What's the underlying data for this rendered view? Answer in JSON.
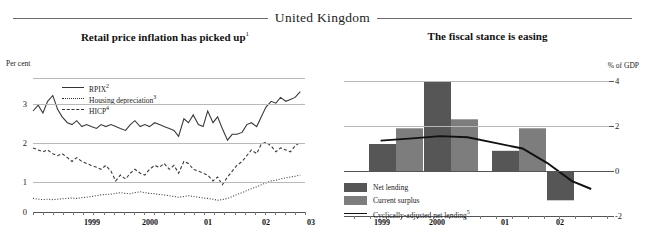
{
  "header": {
    "country": "United Kingdom"
  },
  "left_panel": {
    "title": "Retail price inflation has picked up",
    "title_sup": "1",
    "axis_label": "Per cent",
    "legend": [
      {
        "label": "RPIX",
        "sup": "2",
        "key": "solid"
      },
      {
        "label": "Housing depreciation",
        "sup": "3",
        "key": "dot"
      },
      {
        "label": "HICP",
        "sup": "4",
        "key": "dash"
      }
    ],
    "yticks": [
      "3",
      "2",
      "1",
      "0"
    ],
    "xticks": [
      "1999",
      "2000",
      "01",
      "02",
      "03"
    ]
  },
  "right_panel": {
    "title": "The fiscal stance is easing",
    "axis_label": "% of GDP",
    "legend": [
      {
        "label": "Net lending",
        "sup": "",
        "key": "swatch-dark"
      },
      {
        "label": "Current surplus",
        "sup": "",
        "key": "swatch-gray"
      },
      {
        "label": "Cyclically-adjusted net lending",
        "sup": "5",
        "key": "line"
      }
    ],
    "yticks": [
      "4",
      "2",
      "0",
      "-2"
    ],
    "xticks": [
      "1999",
      "2000",
      "01",
      "02"
    ]
  },
  "chart_data": [
    {
      "type": "line",
      "title": "Retail price inflation has picked up",
      "xlabel": "",
      "ylabel": "Per cent",
      "ylim": [
        0,
        3.45
      ],
      "xlim": [
        1998.58,
        2003.25
      ],
      "grid": true,
      "legend_position": "top-left",
      "yticks": [
        0,
        1,
        2,
        3
      ],
      "xtick_values": [
        1999,
        2000,
        2001,
        2002,
        2003
      ],
      "xtick_labels": [
        "1999",
        "2000",
        "01",
        "02",
        "03"
      ],
      "series": [
        {
          "name": "RPIX",
          "style": "solid",
          "x": [
            1998.58,
            1998.67,
            1998.75,
            1998.83,
            1998.92,
            1999.0,
            1999.08,
            1999.17,
            1999.25,
            1999.33,
            1999.42,
            1999.5,
            1999.58,
            1999.67,
            1999.75,
            1999.83,
            1999.92,
            2000.0,
            2000.08,
            2000.17,
            2000.25,
            2000.33,
            2000.42,
            2000.5,
            2000.58,
            2000.67,
            2000.75,
            2000.83,
            2000.92,
            2001.0,
            2001.08,
            2001.17,
            2001.25,
            2001.33,
            2001.42,
            2001.5,
            2001.58,
            2001.67,
            2001.75,
            2001.83,
            2001.92,
            2002.0,
            2002.08,
            2002.17,
            2002.25,
            2002.33,
            2002.42,
            2002.5,
            2002.58,
            2002.67,
            2002.75,
            2002.83,
            2002.92,
            2003.0,
            2003.08,
            2003.17
          ],
          "y": [
            2.6,
            2.75,
            2.55,
            2.85,
            3.0,
            2.65,
            2.45,
            2.3,
            2.25,
            2.35,
            2.2,
            2.25,
            2.2,
            2.15,
            2.25,
            2.2,
            2.25,
            2.2,
            2.15,
            2.1,
            2.25,
            2.35,
            2.2,
            2.25,
            2.2,
            2.3,
            2.25,
            2.2,
            2.15,
            2.1,
            1.95,
            2.4,
            2.3,
            2.5,
            2.25,
            2.2,
            2.6,
            2.3,
            2.45,
            2.15,
            1.85,
            2.0,
            2.0,
            2.05,
            2.25,
            2.3,
            2.2,
            2.45,
            2.7,
            2.85,
            2.8,
            2.95,
            2.85,
            2.9,
            2.95,
            3.1
          ],
          "annotation": "Solid dark line, RPIX inflation rate"
        },
        {
          "name": "HICP",
          "style": "dashed",
          "x": [
            1998.58,
            1998.67,
            1998.75,
            1998.83,
            1998.92,
            1999.0,
            1999.08,
            1999.17,
            1999.25,
            1999.33,
            1999.42,
            1999.5,
            1999.58,
            1999.67,
            1999.75,
            1999.83,
            1999.92,
            2000.0,
            2000.08,
            2000.17,
            2000.25,
            2000.33,
            2000.42,
            2000.5,
            2000.58,
            2000.67,
            2000.75,
            2000.83,
            2000.92,
            2001.0,
            2001.08,
            2001.17,
            2001.25,
            2001.33,
            2001.42,
            2001.5,
            2001.58,
            2001.67,
            2001.75,
            2001.83,
            2001.92,
            2002.0,
            2002.08,
            2002.17,
            2002.25,
            2002.33,
            2002.42,
            2002.5,
            2002.58,
            2002.67,
            2002.75,
            2002.83,
            2002.92,
            2003.0,
            2003.08,
            2003.17
          ],
          "y": [
            1.65,
            1.6,
            1.55,
            1.6,
            1.5,
            1.45,
            1.5,
            1.4,
            1.3,
            1.4,
            1.3,
            1.25,
            1.2,
            1.15,
            1.1,
            1.2,
            1.05,
            0.8,
            0.95,
            0.85,
            1.0,
            1.1,
            1.0,
            0.95,
            1.1,
            1.2,
            1.15,
            1.25,
            1.1,
            1.2,
            1.0,
            1.3,
            1.25,
            1.1,
            1.05,
            1.0,
            0.95,
            0.8,
            0.9,
            0.7,
            0.9,
            1.05,
            1.2,
            1.3,
            1.45,
            1.6,
            1.5,
            1.75,
            1.8,
            1.7,
            1.55,
            1.65,
            1.6,
            1.55,
            1.7,
            1.8
          ],
          "annotation": "Dashed line, HICP inflation rate"
        },
        {
          "name": "Housing depreciation",
          "style": "dotted",
          "x": [
            1998.58,
            1998.67,
            1998.75,
            1998.83,
            1998.92,
            1999.0,
            1999.08,
            1999.17,
            1999.25,
            1999.33,
            1999.42,
            1999.5,
            1999.58,
            1999.67,
            1999.75,
            1999.83,
            1999.92,
            2000.0,
            2000.08,
            2000.17,
            2000.25,
            2000.33,
            2000.42,
            2000.5,
            2000.58,
            2000.67,
            2000.75,
            2000.83,
            2000.92,
            2001.0,
            2001.08,
            2001.17,
            2001.25,
            2001.33,
            2001.42,
            2001.5,
            2001.58,
            2001.67,
            2001.75,
            2001.83,
            2001.92,
            2002.0,
            2002.08,
            2002.17,
            2002.25,
            2002.33,
            2002.42,
            2002.5,
            2002.58,
            2002.67,
            2002.75,
            2002.83,
            2002.92,
            2003.0,
            2003.08,
            2003.17
          ],
          "y": [
            0.35,
            0.33,
            0.32,
            0.33,
            0.32,
            0.33,
            0.34,
            0.35,
            0.36,
            0.35,
            0.37,
            0.38,
            0.4,
            0.42,
            0.44,
            0.45,
            0.46,
            0.48,
            0.5,
            0.48,
            0.47,
            0.5,
            0.52,
            0.5,
            0.48,
            0.47,
            0.45,
            0.44,
            0.42,
            0.4,
            0.38,
            0.4,
            0.42,
            0.4,
            0.38,
            0.36,
            0.35,
            0.33,
            0.3,
            0.32,
            0.35,
            0.4,
            0.45,
            0.5,
            0.55,
            0.6,
            0.65,
            0.7,
            0.75,
            0.8,
            0.82,
            0.85,
            0.88,
            0.9,
            0.92,
            0.95
          ],
          "annotation": "Dotted line, housing depreciation component"
        }
      ]
    },
    {
      "type": "bar",
      "title": "The fiscal stance is easing",
      "xlabel": "",
      "ylabel": "% of GDP",
      "ylim": [
        -2,
        4
      ],
      "grid": true,
      "legend_position": "bottom-left",
      "yticks": [
        4,
        2,
        0,
        -2
      ],
      "categories": [
        "1999",
        "2000",
        "01",
        "02"
      ],
      "series": [
        {
          "name": "Net lending",
          "values": [
            1.2,
            4.0,
            0.9,
            -1.3
          ],
          "color": "#565656"
        },
        {
          "name": "Current surplus",
          "values": [
            1.9,
            2.3,
            1.9,
            null
          ],
          "color": "#7d7d7d"
        }
      ],
      "line_series": {
        "name": "Cyclically-adjusted net lending",
        "sup": "5",
        "x": [
          1998.72,
          1999.3,
          1999.8,
          2000.3,
          2000.8,
          2001.3,
          2001.75,
          2002.2,
          2002.55
        ],
        "y": [
          1.35,
          1.45,
          1.55,
          1.5,
          1.25,
          1.0,
          0.35,
          -0.45,
          -0.8
        ],
        "color": "#111111"
      }
    }
  ]
}
